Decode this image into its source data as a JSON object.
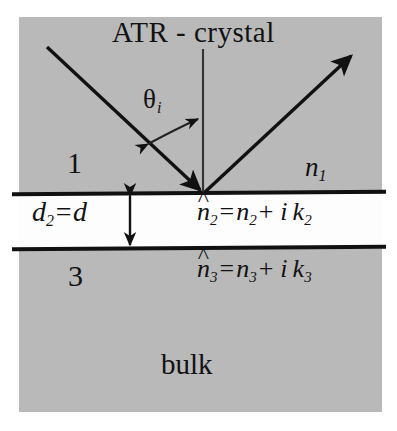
{
  "figure": {
    "title": "ATR - crystal",
    "colors": {
      "medium_fill": "#b9b9b9",
      "film_fill": "#fdfdfd",
      "line": "#111111",
      "text": "#121212"
    }
  },
  "layers": {
    "crystal": {
      "index_label": "1",
      "refractive_index": "n",
      "refractive_index_sub": "1"
    },
    "film": {
      "thickness_symbol": "d",
      "thickness_sub": "2",
      "thickness_equals": "=d",
      "complex_index": {
        "nhat": "n",
        "nhat_sub": "2",
        "hat": "^",
        "equals": "=",
        "n": "n",
        "n_sub": "2",
        "plus": "+",
        "i": "i",
        "k": "k",
        "k_sub": "2"
      }
    },
    "bulk": {
      "index_label": "3",
      "name": "bulk",
      "complex_index": {
        "nhat": "n",
        "nhat_sub": "3",
        "hat": "^",
        "equals": "=",
        "n": "n",
        "n_sub": "3",
        "plus": "+",
        "i": "i",
        "k": "k",
        "k_sub": "3"
      }
    }
  },
  "annotations": {
    "angle_symbol": "θ",
    "angle_sub": "i"
  }
}
